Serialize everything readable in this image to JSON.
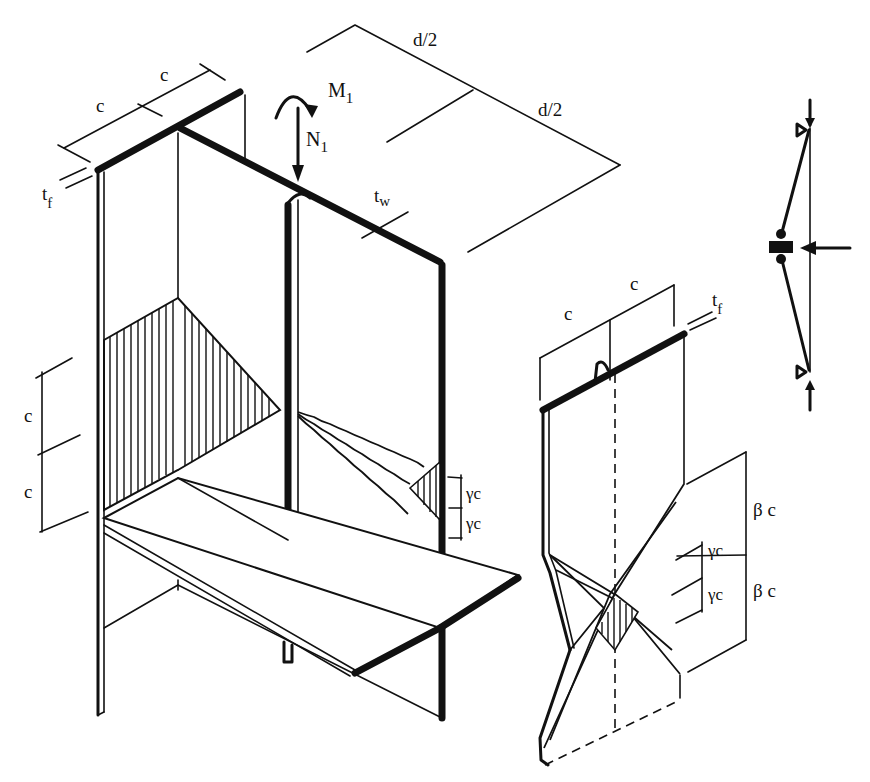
{
  "figure": {
    "type": "isometric structural diagram",
    "colors": {
      "ink": "#111111",
      "background": "#ffffff"
    }
  },
  "labels": {
    "top_c_left": "c",
    "top_c_right": "c",
    "tf_main": "t",
    "tf_main_sub": "f",
    "moment": "M",
    "moment_sub": "1",
    "axial": "N",
    "axial_sub": "1",
    "tw": "t",
    "tw_sub": "w",
    "d_half_upper": "d/2",
    "d_half_lower": "d/2",
    "left_c_upper": "c",
    "left_c_lower": "c",
    "gamma_c_upper": "γc",
    "gamma_c_lower": "γc",
    "detail_c_left": "c",
    "detail_c_right": "c",
    "detail_tf": "t",
    "detail_tf_sub": "f",
    "detail_beta_c_upper": "β c",
    "detail_beta_c_lower": "β c",
    "detail_gamma_c_upper": "γc",
    "detail_gamma_c_lower": "γc"
  },
  "parts": [
    "main-isometric-joint",
    "flange-detail-yield-pattern",
    "mechanism-sketch"
  ]
}
